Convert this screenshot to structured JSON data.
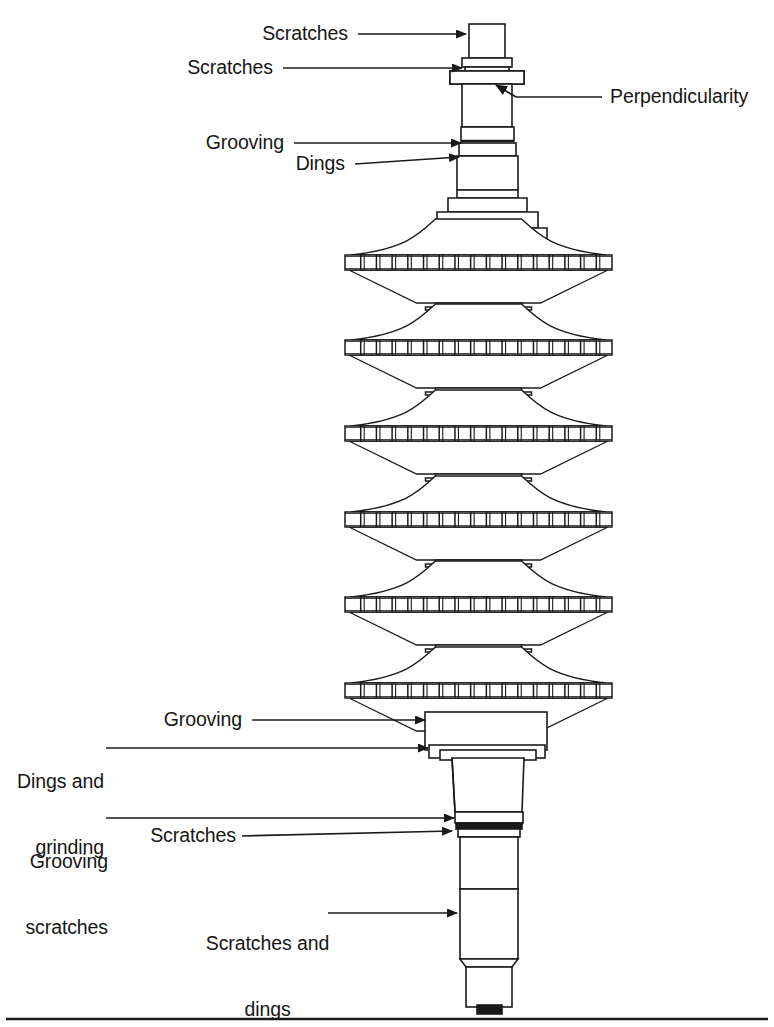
{
  "figure": {
    "kind": "engineering-cross-section",
    "stroke_color": "#1a1a1a",
    "fill_color": "#ffffff",
    "background_color": "#ffffff",
    "footer_rule": true
  },
  "callouts": [
    {
      "id": "scratches-top",
      "text": "Scratches",
      "label_x": 248,
      "label_y": 22,
      "align": "right",
      "label_w": 100,
      "leader": {
        "x1": 358,
        "y1": 34,
        "x2": 466,
        "y2": 34
      },
      "arrow": "right"
    },
    {
      "id": "scratches-second",
      "text": "Scratches",
      "label_x": 173,
      "label_y": 56,
      "align": "right",
      "label_w": 100,
      "leader": {
        "x1": 283,
        "y1": 68,
        "x2": 462,
        "y2": 68
      },
      "arrow": "right"
    },
    {
      "id": "perpendicularity",
      "text": "Perpendicularity",
      "label_x": 610,
      "label_y": 85,
      "align": "left",
      "label_w": 160,
      "leader": {
        "x1": 602,
        "y1": 97,
        "x2": 516,
        "y2": 97
      },
      "elbow": {
        "x": 516,
        "y": 97,
        "x2": 496,
        "y2": 85
      },
      "arrow": "upleft"
    },
    {
      "id": "grooving-top",
      "text": "Grooving",
      "label_x": 188,
      "label_y": 131,
      "align": "right",
      "label_w": 96,
      "leader": {
        "x1": 294,
        "y1": 143,
        "x2": 461,
        "y2": 143
      },
      "arrow": "right"
    },
    {
      "id": "dings-top",
      "text": "Dings",
      "label_x": 284,
      "label_y": 152,
      "align": "right",
      "label_w": 61,
      "leader": {
        "x1": 355,
        "y1": 164,
        "x2": 459,
        "y2": 157
      },
      "arrow": "right"
    },
    {
      "id": "grooving-bottom",
      "text": "Grooving",
      "label_x": 146,
      "label_y": 708,
      "align": "right",
      "label_w": 96,
      "leader": {
        "x1": 252,
        "y1": 720,
        "x2": 425,
        "y2": 720
      },
      "arrow": "right"
    },
    {
      "id": "dings-and-grinding",
      "text": "Dings and\ngrinding",
      "line1": "Dings and",
      "line2": "grinding",
      "label_x": 8,
      "label_y": 726,
      "align": "right",
      "label_w": 96,
      "leader": {
        "x1": 106,
        "y1": 748,
        "x2": 428,
        "y2": 748
      },
      "arrow": "right"
    },
    {
      "id": "grooving-scratches",
      "text": "Grooving\nscratches",
      "line1": "Grooving",
      "line2": "scratches",
      "label_x": 8,
      "label_y": 806,
      "align": "right",
      "label_w": 100,
      "leader": {
        "x1": 106,
        "y1": 818,
        "x2": 454,
        "y2": 818
      },
      "arrow": "right"
    },
    {
      "id": "scratches-lower",
      "text": "Scratches",
      "label_x": 140,
      "label_y": 824,
      "align": "right",
      "label_w": 96,
      "leader": {
        "x1": 242,
        "y1": 836,
        "x2": 452,
        "y2": 831
      },
      "arrow": "right"
    },
    {
      "id": "scratches-and-dings",
      "text": "Scratches and\ndings",
      "line1": "Scratches and",
      "line2": "dings",
      "label_x": 210,
      "label_y": 888,
      "align": "center",
      "label_w": 150,
      "leader": {
        "x1": 328,
        "y1": 913,
        "x2": 457,
        "y2": 913
      },
      "arrow": "right"
    }
  ],
  "discs": [
    {
      "index": 1,
      "band_top": 255,
      "band_bottom": 270,
      "band_left": 345,
      "band_right": 612
    },
    {
      "index": 2,
      "band_top": 340,
      "band_bottom": 355,
      "band_left": 345,
      "band_right": 612
    },
    {
      "index": 3,
      "band_top": 426,
      "band_bottom": 441,
      "band_left": 345,
      "band_right": 612
    },
    {
      "index": 4,
      "band_top": 512,
      "band_bottom": 527,
      "band_left": 345,
      "band_right": 612
    },
    {
      "index": 5,
      "band_top": 597,
      "band_bottom": 612,
      "band_left": 345,
      "band_right": 612
    },
    {
      "index": 6,
      "band_top": 683,
      "band_bottom": 698,
      "band_left": 345,
      "band_right": 612
    }
  ],
  "blade_ticks_per_disc": 17
}
